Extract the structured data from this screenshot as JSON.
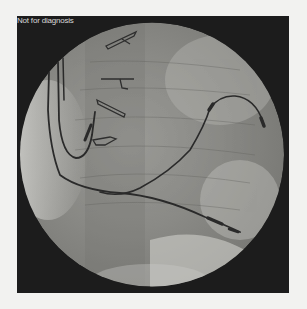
{
  "viewer": {
    "overlay_label": "Not for diagnosis",
    "image_type": "fluoroscopy-xray",
    "colors": {
      "page_background": "#f2f2f0",
      "frame_background": "#1c1c1c",
      "field_light": "#c8c8c4",
      "field_mid": "#8e8e8a",
      "catheter": "#2a2a2a"
    }
  }
}
